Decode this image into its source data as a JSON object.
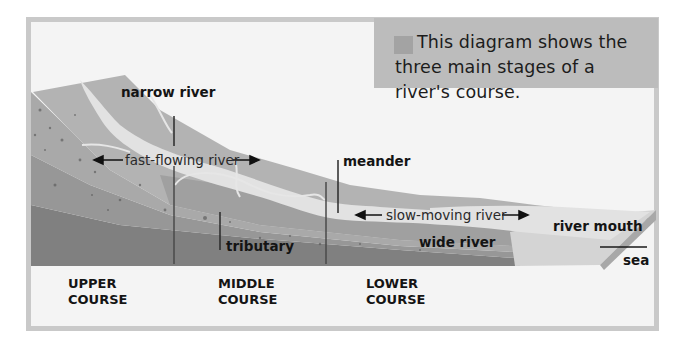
{
  "caption": {
    "text": "This diagram shows the three main stages of a river's course.",
    "swatch_color": "#a3a3a3",
    "box_color": "#bcbcbc"
  },
  "labels": {
    "narrow_river": "narrow river",
    "fast_flowing_river": "fast-flowing river",
    "meander": "meander",
    "tributary": "tributary",
    "slow_moving_river": "slow-moving river",
    "wide_river": "wide river",
    "river_mouth": "river mouth",
    "sea": "sea"
  },
  "courses": {
    "upper": {
      "line1": "UPPER",
      "line2": "COURSE"
    },
    "middle": {
      "line1": "MIDDLE",
      "line2": "COURSE"
    },
    "lower": {
      "line1": "LOWER",
      "line2": "COURSE"
    }
  },
  "colors": {
    "panel_bg": "#f4f4f4",
    "border": "#c9c9c9",
    "land_top": "#b5b5b5",
    "land_mid": "#a6a6a6",
    "rock_layer": "#9a9a9a",
    "bedrock": "#7e7e7e",
    "river": "#e3e3e3",
    "sea": "#d6d6d6"
  }
}
